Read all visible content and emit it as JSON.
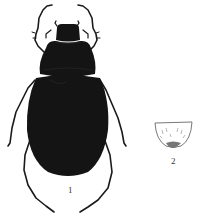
{
  "figure": {
    "panels": [
      {
        "id": "1",
        "label": "1",
        "subject": "beetle-dorsal-view"
      },
      {
        "id": "2",
        "label": "2",
        "subject": "pygidium-detail"
      }
    ],
    "colors": {
      "body": "#141414",
      "outline": "#222222",
      "background": "#ffffff"
    }
  }
}
